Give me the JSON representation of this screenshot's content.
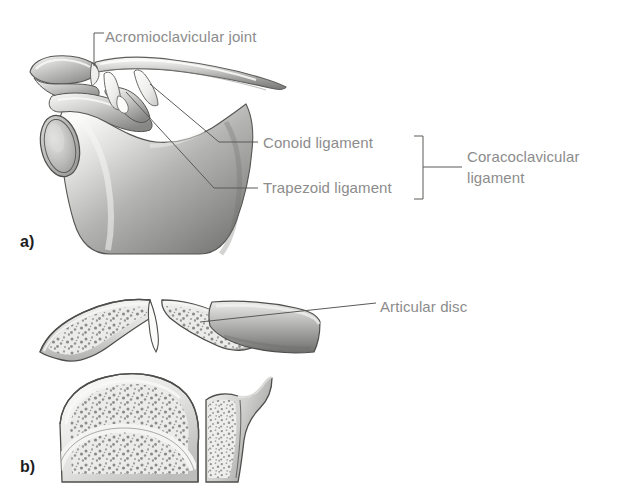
{
  "figure": {
    "background_color": "#ffffff",
    "label_color": "#8c8c8c",
    "leader_line_color": "#5a5a5a",
    "panel_letter_color": "#1d1d1d",
    "width": 618,
    "height": 498
  },
  "panels": [
    {
      "letter": "a)",
      "view": "anterior view of scapula, clavicle and ligaments"
    },
    {
      "letter": "b)",
      "view": "sectional views of the acromioclavicular joint"
    }
  ],
  "labels": {
    "acromioclavicular_joint": "Acromioclavicular joint",
    "conoid_ligament": "Conoid ligament",
    "trapezoid_ligament": "Trapezoid ligament",
    "coracoclavicular_ligament": "Coracoclavicular ligament",
    "articular_disc": "Articular disc"
  },
  "anatomy": {
    "bone_fill_light": "#f2f2f0",
    "bone_fill_mid": "#b8b8b6",
    "bone_fill_dark": "#7d7d7b",
    "bone_outline": "#4a4a48",
    "ligament_fill": "#fbfbfa",
    "trabecular_color": "#6f6f6d"
  }
}
